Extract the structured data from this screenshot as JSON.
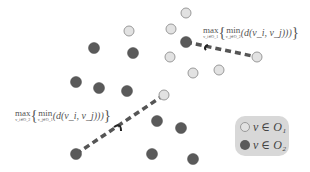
{
  "colors": {
    "set1_fill": "#e2e2e2",
    "set1_stroke": "#9a9a9a",
    "set2_fill": "#5a5a5a",
    "set2_stroke": "#4a4a4a",
    "line": "#555555",
    "legend_bg": "#d8d8d8"
  },
  "points": {
    "O1": [
      [
        129,
        31
      ],
      [
        186,
        13
      ],
      [
        171,
        29
      ],
      [
        170,
        57
      ],
      [
        193,
        73
      ],
      [
        219,
        70
      ],
      [
        257,
        57
      ],
      [
        164,
        95
      ]
    ],
    "O2": [
      [
        94,
        48
      ],
      [
        133,
        53
      ],
      [
        76,
        82
      ],
      [
        99,
        88
      ],
      [
        127,
        91
      ],
      [
        186,
        42
      ],
      [
        157,
        121
      ],
      [
        181,
        128
      ],
      [
        152,
        154
      ],
      [
        193,
        159
      ],
      [
        76,
        154
      ]
    ]
  },
  "links": [
    {
      "from": [
        186,
        42
      ],
      "to": [
        257,
        57
      ]
    },
    {
      "from": [
        76,
        154
      ],
      "to": [
        164,
        95
      ]
    }
  ],
  "formula_top": {
    "max": "max",
    "max_sub": "v_i∈O_1",
    "min": "min",
    "min_sub": "v_j∈O_2",
    "expr": "d(v_i, v_j)"
  },
  "formula_bottom": {
    "max": "max",
    "max_sub": "v_i∈O_2",
    "min": "min",
    "min_sub": "v_j∈O_1",
    "expr": "d(v_i, v_j)"
  },
  "legend": {
    "item1": "v ∈ O₁",
    "item2": "v ∈ O₂"
  }
}
